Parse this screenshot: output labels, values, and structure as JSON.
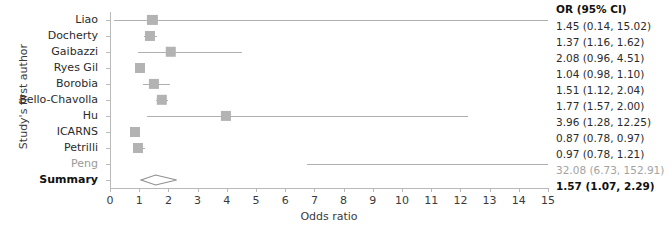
{
  "axis": {
    "y_title": "Study's first author",
    "x_title": "Odds ratio",
    "x_ticks": [
      0,
      1,
      2,
      3,
      4,
      5,
      6,
      7,
      8,
      9,
      10,
      11,
      12,
      13,
      14,
      15
    ]
  },
  "or_column": {
    "header": "OR (95% CI)"
  },
  "colors": {
    "marker": "#b3b3b3",
    "line": "#b0b0b0",
    "axis": "#b9b9b9",
    "text": "#2b2b2b",
    "dim_text": "#9a9a9a",
    "bold_text": "#111111"
  },
  "chart_data": {
    "type": "forest",
    "title": "",
    "xlabel": "Odds ratio",
    "ylabel": "Study's first author",
    "xlim": [
      0,
      15
    ],
    "xticks": [
      0,
      1,
      2,
      3,
      4,
      5,
      6,
      7,
      8,
      9,
      10,
      11,
      12,
      13,
      14,
      15
    ],
    "grid": false,
    "legend": "none",
    "effect_measure": "OR (95% CI)",
    "rows": [
      {
        "study": "Liao",
        "or": 1.45,
        "lower": 0.14,
        "upper": 15.02,
        "label": "1.45 (0.14, 15.02)",
        "weight": 0.55,
        "type": "study",
        "dim": false
      },
      {
        "study": "Docherty",
        "or": 1.37,
        "lower": 1.16,
        "upper": 1.62,
        "label": "1.37 (1.16, 1.62)",
        "weight": 0.52,
        "type": "study",
        "dim": false
      },
      {
        "study": "Gaibazzi",
        "or": 2.08,
        "lower": 0.96,
        "upper": 4.51,
        "label": "2.08 (0.96, 4.51)",
        "weight": 0.62,
        "type": "study",
        "dim": false
      },
      {
        "study": "Ryes Gil",
        "or": 1.04,
        "lower": 0.98,
        "upper": 1.1,
        "label": "1.04 (0.98, 1.10)",
        "weight": 0.5,
        "type": "study",
        "dim": false
      },
      {
        "study": "Borobia",
        "or": 1.51,
        "lower": 1.12,
        "upper": 2.04,
        "label": "1.51 (1.12, 2.04)",
        "weight": 0.55,
        "type": "study",
        "dim": false
      },
      {
        "study": "Bello-Chavolla",
        "or": 1.77,
        "lower": 1.57,
        "upper": 2.0,
        "label": "1.77 (1.57, 2.00)",
        "weight": 0.6,
        "type": "study",
        "dim": false
      },
      {
        "study": "Hu",
        "or": 3.96,
        "lower": 1.28,
        "upper": 12.25,
        "label": "3.96 (1.28, 12.25)",
        "weight": 0.55,
        "type": "study",
        "dim": false
      },
      {
        "study": "ICARNS",
        "or": 0.87,
        "lower": 0.78,
        "upper": 0.97,
        "label": "0.87 (0.78, 0.97)",
        "weight": 0.5,
        "type": "study",
        "dim": false
      },
      {
        "study": "Petrilli",
        "or": 0.97,
        "lower": 0.78,
        "upper": 1.21,
        "label": "0.97 (0.78, 1.21)",
        "weight": 0.5,
        "type": "study",
        "dim": false
      },
      {
        "study": "Peng",
        "or": 32.08,
        "lower": 6.73,
        "upper": 152.91,
        "label": "32.08 (6.73, 152.91)",
        "weight": 0,
        "type": "study",
        "dim": true
      },
      {
        "study": "Summary",
        "or": 1.57,
        "lower": 1.07,
        "upper": 2.29,
        "label": "1.57 (1.07, 2.29)",
        "weight": 0,
        "type": "summary",
        "dim": false
      }
    ]
  }
}
